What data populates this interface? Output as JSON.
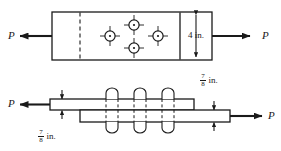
{
  "figure": {
    "colors": {
      "line": "#1a1a1a",
      "background": "#ffffff",
      "hidden_line": "#1a1a1a"
    },
    "top_view": {
      "name": "plan-view-plate",
      "load_left_label": "P",
      "load_right_label": "P",
      "width_dimension": "4 in.",
      "rivet_count": 4,
      "rivet_pattern": "diamond",
      "rivets": [
        {
          "id": "rivet-left",
          "cx": 110,
          "cy": 36
        },
        {
          "id": "rivet-top",
          "cx": 134,
          "cy": 25
        },
        {
          "id": "rivet-right",
          "cx": 158,
          "cy": 36
        },
        {
          "id": "rivet-bottom",
          "cx": 134,
          "cy": 48
        }
      ]
    },
    "bottom_view": {
      "name": "elevation-view-lap-joint",
      "load_left_label": "P",
      "load_right_label": "P",
      "thickness_top": {
        "numerator": "7",
        "denominator": "8",
        "unit": "in."
      },
      "thickness_bottom": {
        "numerator": "7",
        "denominator": "8",
        "unit": "in."
      },
      "rivet_count": 3,
      "rivets": [
        {
          "id": "rivet-1",
          "cx": 112
        },
        {
          "id": "rivet-2",
          "cx": 140
        },
        {
          "id": "rivet-3",
          "cx": 168
        }
      ]
    }
  }
}
